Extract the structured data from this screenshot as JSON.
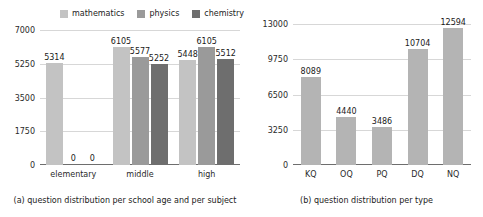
{
  "figure": {
    "panels": [
      {
        "id": "panel-a",
        "caption": "(a) question distribution per school age and per subject"
      },
      {
        "id": "panel-b",
        "caption": "(b) question distribution per type"
      }
    ]
  },
  "legend": {
    "position": "top",
    "items": [
      {
        "label": "mathematics",
        "color": "#c3c3c3"
      },
      {
        "label": "physics",
        "color": "#9a9a9a"
      },
      {
        "label": "chemistry",
        "color": "#6e6e6e"
      }
    ]
  },
  "chart_data": [
    {
      "type": "bar",
      "title": "",
      "subtitle": "",
      "caption": "(a) question distribution per school age and per subject",
      "xlabel": "",
      "ylabel": "",
      "categories": [
        "elementary",
        "middle",
        "high"
      ],
      "series": [
        {
          "name": "mathematics",
          "color": "#c3c3c3",
          "values": [
            5314,
            6105,
            5448
          ]
        },
        {
          "name": "physics",
          "color": "#9a9a9a",
          "values": [
            0,
            5577,
            6105
          ]
        },
        {
          "name": "chemistry",
          "color": "#6e6e6e",
          "values": [
            0,
            5252,
            5512
          ]
        }
      ],
      "yticks": [
        0,
        1750,
        3500,
        5250,
        7000
      ],
      "ytick_labels": [
        "0",
        "1750",
        "3500",
        "5250",
        "7000"
      ],
      "ylim": [
        0,
        7000
      ],
      "grid": true,
      "legend_position": "top",
      "data_labels": true
    },
    {
      "type": "bar",
      "title": "",
      "subtitle": "",
      "caption": "(b) question distribution per type",
      "xlabel": "",
      "ylabel": "",
      "categories": [
        "KQ",
        "OQ",
        "PQ",
        "DQ",
        "NQ"
      ],
      "values": [
        8089,
        4440,
        3486,
        10704,
        12594
      ],
      "color": "#b4b4b4",
      "yticks": [
        0,
        3250,
        6500,
        9750,
        13000
      ],
      "ytick_labels": [
        "0",
        "3250",
        "6500",
        "9750",
        "13000"
      ],
      "ylim": [
        0,
        13000
      ],
      "grid": true,
      "legend_position": "none",
      "data_labels": true
    }
  ],
  "colors": {
    "mathematics": "#c3c3c3",
    "physics": "#9a9a9a",
    "chemistry": "#6e6e6e",
    "single_series": "#b4b4b4",
    "gridline": "#d7d7d7",
    "axis": "#6e6e6e",
    "text": "#1a1a1a",
    "background": "#ffffff"
  }
}
